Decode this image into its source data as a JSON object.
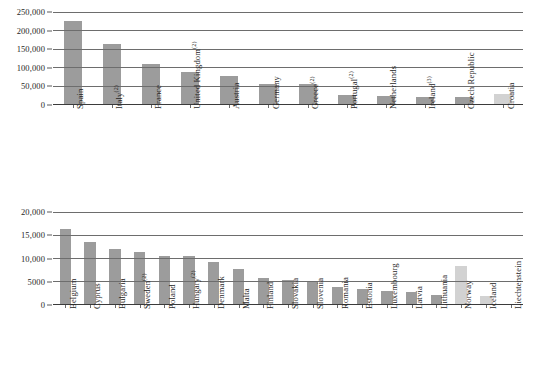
{
  "chart_data": [
    {
      "id": "top",
      "type": "bar",
      "title": "",
      "xlabel": "",
      "ylabel": "",
      "ylim": [
        0,
        250000
      ],
      "yticks": [
        0,
        50000,
        100000,
        150000,
        200000,
        250000
      ],
      "ytick_labels": [
        "0",
        "50,000",
        "100,000",
        "150,000",
        "200,000",
        "250,000"
      ],
      "grid": true,
      "legend": "none",
      "categories": [
        "Spain",
        "Italy(2)",
        "France",
        "United Kingdom(2)",
        "Austria",
        "Germany",
        "Greece(2)",
        "Portugal(2)",
        "Netherlands",
        "Ireland(3)",
        "Czech Republic",
        "Croatia"
      ],
      "category_labels": [
        {
          "text": "Spain",
          "sup": ""
        },
        {
          "text": "Italy",
          "sup": "(2)"
        },
        {
          "text": "France",
          "sup": ""
        },
        {
          "text": "United Kingdom",
          "sup": "(2)"
        },
        {
          "text": "Austria",
          "sup": ""
        },
        {
          "text": "Germany",
          "sup": ""
        },
        {
          "text": "Greece",
          "sup": "(2)"
        },
        {
          "text": "Portugal",
          "sup": "(2)"
        },
        {
          "text": "Netherlands",
          "sup": ""
        },
        {
          "text": "Ireland",
          "sup": "(3)"
        },
        {
          "text": "Czech Republic",
          "sup": ""
        },
        {
          "text": "Croatia",
          "sup": ""
        }
      ],
      "values": [
        223000,
        161000,
        107000,
        85000,
        76000,
        54000,
        53000,
        25000,
        22000,
        20000,
        20000,
        27000
      ],
      "bar_styles": [
        "dark",
        "dark",
        "dark",
        "dark",
        "dark",
        "dark",
        "dark",
        "dark",
        "dark",
        "dark",
        "dark",
        "light"
      ]
    },
    {
      "id": "bottom",
      "type": "bar",
      "title": "",
      "xlabel": "",
      "ylabel": "",
      "ylim": [
        0,
        20000
      ],
      "yticks": [
        0,
        5000,
        10000,
        15000,
        20000
      ],
      "ytick_labels": [
        "0",
        "5000",
        "10,000",
        "15,000",
        "20,000"
      ],
      "grid": true,
      "legend": "none",
      "categories": [
        "Belgium",
        "Cyprus",
        "Bulgaria",
        "Sweden(2)",
        "Poland",
        "Hungary(2)",
        "Denmark",
        "Malta",
        "Finland",
        "Slovakia",
        "Slovenia",
        "Romania",
        "Estonia",
        "Luxembourg",
        "Latvia",
        "Lithuania",
        "Norway",
        "Iceland",
        "Liechtenstein"
      ],
      "category_labels": [
        {
          "text": "Belgium",
          "sup": ""
        },
        {
          "text": "Cyprus",
          "sup": ""
        },
        {
          "text": "Bulgaria",
          "sup": ""
        },
        {
          "text": "Sweden",
          "sup": "(2)"
        },
        {
          "text": "Poland",
          "sup": ""
        },
        {
          "text": "Hungary",
          "sup": "(2)"
        },
        {
          "text": "Denmark",
          "sup": ""
        },
        {
          "text": "Malta",
          "sup": ""
        },
        {
          "text": "Finland",
          "sup": ""
        },
        {
          "text": "Slovakia",
          "sup": ""
        },
        {
          "text": "Slovenia",
          "sup": ""
        },
        {
          "text": "Romania",
          "sup": ""
        },
        {
          "text": "Estonia",
          "sup": ""
        },
        {
          "text": "Luxembourg",
          "sup": ""
        },
        {
          "text": "Latvia",
          "sup": ""
        },
        {
          "text": "Lithuania",
          "sup": ""
        },
        {
          "text": "Norway",
          "sup": ""
        },
        {
          "text": "Iceland",
          "sup": ""
        },
        {
          "text": "Liechtenstein",
          "sup": ""
        }
      ],
      "values": [
        16200,
        13300,
        11900,
        11200,
        10300,
        10250,
        9000,
        7600,
        5600,
        5100,
        5050,
        3600,
        3200,
        2700,
        2500,
        1900,
        8100,
        1800,
        0
      ],
      "bar_styles": [
        "dark",
        "dark",
        "dark",
        "dark",
        "dark",
        "dark",
        "dark",
        "dark",
        "dark",
        "dark",
        "dark",
        "dark",
        "dark",
        "dark",
        "dark",
        "dark",
        "light",
        "light",
        "dark"
      ]
    }
  ],
  "colors": {
    "bar_dark": "#9c9c9c",
    "bar_light": "#d2d2d2",
    "gridline": "#6d6d6d",
    "axis": "#3b3b3b",
    "text": "#1f1f1f",
    "background": "#ffffff"
  }
}
